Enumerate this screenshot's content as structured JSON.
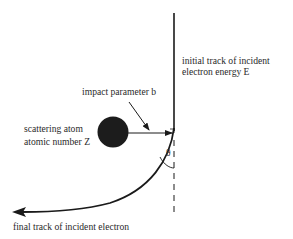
{
  "diagram": {
    "labels": {
      "initial_track_line1": "initial track of incident",
      "initial_track_line2": "electron energy E",
      "impact_parameter": "impact parameter b",
      "atom_line1": "scattering atom",
      "atom_line2": "atomic number Z",
      "angle": "θ",
      "final_track": "final track of incident electron"
    },
    "colors": {
      "line": "#1a1a1a",
      "atom": "#1c1c1c",
      "text": "#2a2a2a"
    }
  }
}
